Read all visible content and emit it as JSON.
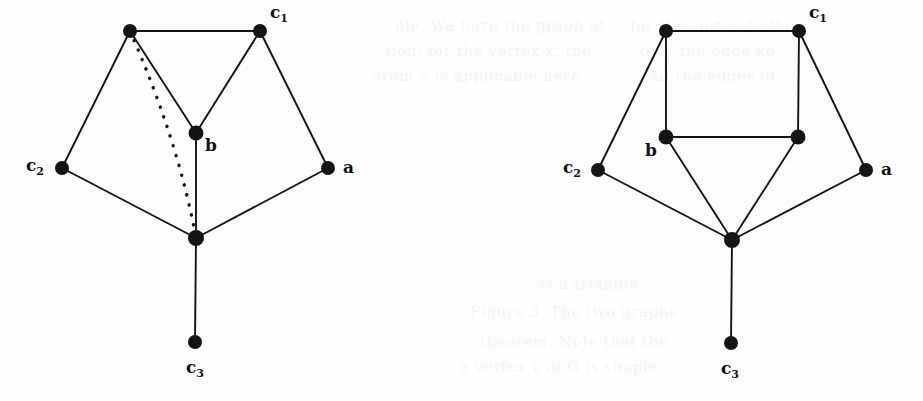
{
  "figure": {
    "kind": "graph-diagram-pair",
    "background_color": "#fdfdfc",
    "ink_color": "#141414",
    "width": 923,
    "height": 401
  },
  "ghost_text": {
    "description": "faint show-through text from reverse of scanned page",
    "lines": [
      {
        "text": "ple. We have the graph of",
        "x": 395,
        "y": 14
      },
      {
        "text": "tion: for the vertex x, the",
        "x": 385,
        "y": 39
      },
      {
        "text": "orem 2 is applicable here",
        "x": 372,
        "y": 64
      },
      {
        "text": "for the vertex b, the",
        "x": 630,
        "y": 14
      },
      {
        "text": "only the edge xb",
        "x": 640,
        "y": 39
      },
      {
        "text": "All the edges of",
        "x": 648,
        "y": 64
      },
      {
        "text": "is a triangle",
        "x": 540,
        "y": 272
      },
      {
        "text": "Figure 3. The two graphs",
        "x": 470,
        "y": 300
      },
      {
        "text": "theorem. Note that the",
        "x": 480,
        "y": 330
      },
      {
        "text": "a vertex v of G is simple",
        "x": 460,
        "y": 355
      }
    ]
  },
  "graphs": [
    {
      "id": "graph-left",
      "name": "left-graph",
      "nodes": [
        {
          "id": "v_topleft",
          "cx": 130,
          "cy": 31,
          "r": 7.0,
          "label": null
        },
        {
          "id": "v_c1",
          "cx": 260,
          "cy": 31,
          "r": 7.0,
          "label": "c",
          "sub": "1",
          "lx": 270,
          "ly": 4
        },
        {
          "id": "v_b",
          "cx": 196,
          "cy": 133,
          "r": 7.5,
          "label": "b",
          "sub": null,
          "lx": 205,
          "ly": 137
        },
        {
          "id": "v_c2",
          "cx": 62,
          "cy": 168,
          "r": 7.0,
          "label": "c",
          "sub": "2",
          "lx": 26,
          "ly": 157
        },
        {
          "id": "v_a",
          "cx": 328,
          "cy": 168,
          "r": 7.0,
          "label": "a",
          "sub": null,
          "lx": 343,
          "ly": 159
        },
        {
          "id": "v_bottom",
          "cx": 196,
          "cy": 238,
          "r": 8.0,
          "label": null
        },
        {
          "id": "v_c3",
          "cx": 195,
          "cy": 342,
          "r": 7.0,
          "label": "c",
          "sub": "3",
          "lx": 186,
          "ly": 359
        }
      ],
      "edges": [
        {
          "from": "v_topleft",
          "to": "v_c1",
          "style": "solid"
        },
        {
          "from": "v_topleft",
          "to": "v_c2",
          "style": "solid"
        },
        {
          "from": "v_topleft",
          "to": "v_b",
          "style": "solid"
        },
        {
          "from": "v_c1",
          "to": "v_b",
          "style": "solid"
        },
        {
          "from": "v_c1",
          "to": "v_a",
          "style": "solid"
        },
        {
          "from": "v_c2",
          "to": "v_bottom",
          "style": "solid"
        },
        {
          "from": "v_a",
          "to": "v_bottom",
          "style": "solid"
        },
        {
          "from": "v_b",
          "to": "v_bottom",
          "style": "solid"
        },
        {
          "from": "v_bottom",
          "to": "v_c3",
          "style": "solid"
        },
        {
          "from": "v_topleft",
          "to": "v_bottom",
          "style": "dotted",
          "curve": {
            "cx": 178,
            "cy": 140
          }
        }
      ]
    },
    {
      "id": "graph-right",
      "name": "right-graph",
      "nodes": [
        {
          "id": "w_topleft",
          "cx": 666,
          "cy": 31,
          "r": 7.0,
          "label": null
        },
        {
          "id": "w_c1",
          "cx": 799,
          "cy": 31,
          "r": 7.0,
          "label": "c",
          "sub": "1",
          "lx": 809,
          "ly": 4
        },
        {
          "id": "w_b",
          "cx": 666,
          "cy": 137,
          "r": 7.5,
          "label": "b",
          "sub": null,
          "lx": 645,
          "ly": 142
        },
        {
          "id": "w_inner_r",
          "cx": 798,
          "cy": 137,
          "r": 7.5,
          "label": null
        },
        {
          "id": "w_c2",
          "cx": 598,
          "cy": 170,
          "r": 7.0,
          "label": "c",
          "sub": "2",
          "lx": 563,
          "ly": 159
        },
        {
          "id": "w_a",
          "cx": 866,
          "cy": 170,
          "r": 7.0,
          "label": "a",
          "sub": null,
          "lx": 881,
          "ly": 161
        },
        {
          "id": "w_bottom",
          "cx": 732,
          "cy": 240,
          "r": 8.0,
          "label": null
        },
        {
          "id": "w_c3",
          "cx": 731,
          "cy": 343,
          "r": 7.0,
          "label": "c",
          "sub": "3",
          "lx": 721,
          "ly": 360
        }
      ],
      "edges": [
        {
          "from": "w_topleft",
          "to": "w_c1",
          "style": "solid"
        },
        {
          "from": "w_topleft",
          "to": "w_b",
          "style": "solid"
        },
        {
          "from": "w_topleft",
          "to": "w_c2",
          "style": "solid"
        },
        {
          "from": "w_c1",
          "to": "w_inner_r",
          "style": "solid"
        },
        {
          "from": "w_c1",
          "to": "w_a",
          "style": "solid"
        },
        {
          "from": "w_b",
          "to": "w_inner_r",
          "style": "solid"
        },
        {
          "from": "w_b",
          "to": "w_bottom",
          "style": "solid"
        },
        {
          "from": "w_inner_r",
          "to": "w_bottom",
          "style": "solid"
        },
        {
          "from": "w_c2",
          "to": "w_bottom",
          "style": "solid"
        },
        {
          "from": "w_a",
          "to": "w_bottom",
          "style": "solid"
        },
        {
          "from": "w_bottom",
          "to": "w_c3",
          "style": "solid"
        }
      ]
    }
  ]
}
